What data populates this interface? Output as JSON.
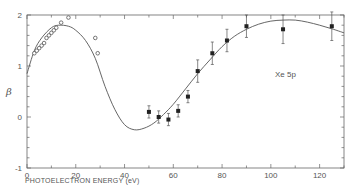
{
  "chart_data": {
    "type": "scatter",
    "title": "",
    "xlabel": "PHOTOELECTRON ENERGY (eV)",
    "ylabel": "β",
    "xlim": [
      0,
      130
    ],
    "ylim": [
      -1,
      2
    ],
    "x_ticks": [
      0,
      20,
      40,
      60,
      80,
      100,
      120
    ],
    "y_ticks": [
      -1,
      0,
      1,
      2
    ],
    "annotation": "Xe 5p",
    "grid": false,
    "legend": null,
    "series": [
      {
        "name": "open circles",
        "marker": "open-circle",
        "x": [
          3,
          4,
          5,
          6,
          7,
          8,
          9,
          10,
          11,
          12,
          14,
          17,
          28,
          29
        ],
        "y": [
          1.25,
          1.3,
          1.35,
          1.4,
          1.45,
          1.55,
          1.6,
          1.65,
          1.7,
          1.75,
          1.85,
          1.95,
          1.55,
          1.25
        ]
      },
      {
        "name": "filled circles with error bars",
        "marker": "filled-square",
        "x": [
          50,
          54,
          58,
          62,
          66,
          70,
          76,
          82,
          90,
          105,
          125
        ],
        "y": [
          0.1,
          0.0,
          -0.05,
          0.12,
          0.4,
          0.9,
          1.25,
          1.5,
          1.78,
          1.72,
          1.78
        ],
        "err": [
          0.12,
          0.12,
          0.12,
          0.12,
          0.12,
          0.22,
          0.22,
          0.22,
          0.22,
          0.28,
          0.28
        ]
      },
      {
        "name": "theory curve",
        "marker": "line",
        "x": [
          0,
          3,
          6,
          10,
          13,
          17,
          20,
          24,
          28,
          32,
          36,
          40,
          44,
          48,
          52,
          56,
          60,
          65,
          70,
          75,
          80,
          85,
          90,
          95,
          100,
          105,
          110,
          115,
          120,
          125,
          130
        ],
        "y": [
          0.85,
          1.3,
          1.55,
          1.75,
          1.8,
          1.78,
          1.7,
          1.5,
          1.15,
          0.6,
          0.15,
          -0.15,
          -0.25,
          -0.22,
          -0.12,
          0.05,
          0.25,
          0.55,
          0.85,
          1.12,
          1.38,
          1.58,
          1.72,
          1.82,
          1.88,
          1.9,
          1.9,
          1.86,
          1.8,
          1.73,
          1.65
        ]
      }
    ]
  }
}
